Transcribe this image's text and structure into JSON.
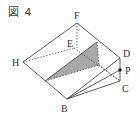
{
  "figure": {
    "title": "図 4",
    "colors": {
      "line": "#333333",
      "shade": "#a9a9a9",
      "background": "#ffffff"
    },
    "vertices": [
      {
        "name": "F",
        "x": 77,
        "y": 23,
        "lx": 74,
        "ly": 19
      },
      {
        "name": "E",
        "x": 74,
        "y": 48,
        "lx": 66,
        "ly": 47
      },
      {
        "name": "H",
        "x": 23,
        "y": 62,
        "lx": 12,
        "ly": 66
      },
      {
        "name": "B",
        "x": 67,
        "y": 99,
        "lx": 61,
        "ly": 112
      },
      {
        "name": "D",
        "x": 120,
        "y": 58,
        "lx": 123,
        "ly": 57
      },
      {
        "name": "C",
        "x": 120,
        "y": 81,
        "lx": 122,
        "ly": 92
      },
      {
        "name": "P",
        "x": 120,
        "y": 70,
        "lx": 125,
        "ly": 74
      }
    ]
  }
}
